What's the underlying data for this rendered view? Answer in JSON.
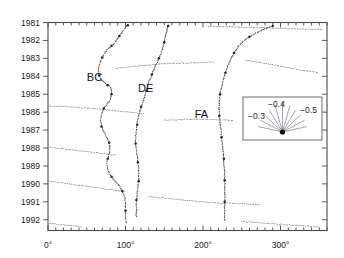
{
  "chart_data": {
    "type": "scatter",
    "title": "",
    "xlabel": "",
    "ylabel": "",
    "xlim": [
      0,
      360
    ],
    "ylim": [
      1981,
      1992.6
    ],
    "y_axis_inverted": true,
    "grid": false,
    "x_ticks_major": [
      "0°",
      "100°",
      "200°",
      "300°"
    ],
    "x_tick_values_major": [
      0,
      100,
      200,
      300
    ],
    "x_tick_interval_minor": 10,
    "y_ticks": [
      "1981",
      "1982",
      "1983",
      "1984",
      "1985",
      "1986",
      "1987",
      "1988",
      "1989",
      "1990",
      "1991",
      "1992"
    ],
    "y_tick_values": [
      1981,
      1982,
      1983,
      1984,
      1985,
      1986,
      1987,
      1988,
      1989,
      1990,
      1991,
      1992
    ],
    "annotations": [
      {
        "text": "BC",
        "x": 60,
        "y": 1984.25
      },
      {
        "text": "DE",
        "x": 126,
        "y": 1984.9
      },
      {
        "text": "FA",
        "x": 198,
        "y": 1986.35
      }
    ],
    "series": [
      {
        "name": "BC",
        "points": [
          [
            103,
            1981.15
          ],
          [
            100,
            1981.3
          ],
          [
            96,
            1981.5
          ],
          [
            92,
            1981.75
          ],
          [
            88,
            1982.0
          ],
          [
            85,
            1982.2
          ],
          [
            82,
            1982.3
          ],
          [
            78,
            1982.45
          ],
          [
            74,
            1982.65
          ],
          [
            70,
            1982.95
          ],
          [
            67,
            1983.25
          ],
          [
            65,
            1983.6
          ],
          [
            66,
            1983.95
          ],
          [
            69,
            1984.2
          ],
          [
            73,
            1984.35
          ],
          [
            77,
            1984.5
          ],
          [
            80,
            1984.6
          ],
          [
            82,
            1984.75
          ],
          [
            82,
            1985.0
          ],
          [
            80,
            1985.3
          ],
          [
            76,
            1985.55
          ],
          [
            72,
            1985.8
          ],
          [
            69,
            1986.1
          ],
          [
            68,
            1986.45
          ],
          [
            69,
            1986.8
          ],
          [
            72,
            1987.1
          ],
          [
            76,
            1987.4
          ],
          [
            79,
            1987.7
          ],
          [
            80,
            1988.0
          ],
          [
            79,
            1988.3
          ],
          [
            77,
            1988.6
          ],
          [
            76,
            1988.95
          ],
          [
            78,
            1989.3
          ],
          [
            82,
            1989.6
          ],
          [
            87,
            1989.85
          ],
          [
            92,
            1990.1
          ],
          [
            96,
            1990.4
          ],
          [
            99,
            1990.75
          ],
          [
            100,
            1991.1
          ],
          [
            100,
            1991.5
          ],
          [
            100,
            1991.9
          ],
          [
            101,
            1992.25
          ]
        ]
      },
      {
        "name": "DE",
        "points": [
          [
            155,
            1981.2
          ],
          [
            153,
            1981.5
          ],
          [
            151,
            1981.8
          ],
          [
            150,
            1982.1
          ],
          [
            148,
            1982.4
          ],
          [
            146,
            1982.7
          ],
          [
            143,
            1983.0
          ],
          [
            140,
            1983.3
          ],
          [
            137,
            1983.6
          ],
          [
            134,
            1983.9
          ],
          [
            131,
            1984.2
          ],
          [
            129,
            1984.5
          ],
          [
            127,
            1984.8
          ],
          [
            125,
            1985.1
          ],
          [
            123,
            1985.4
          ],
          [
            120,
            1985.7
          ],
          [
            118,
            1986.0
          ],
          [
            116,
            1986.35
          ],
          [
            115,
            1986.7
          ],
          [
            114,
            1987.05
          ],
          [
            113,
            1987.4
          ],
          [
            113,
            1987.75
          ],
          [
            114,
            1988.1
          ],
          [
            115,
            1988.45
          ],
          [
            116,
            1988.8
          ],
          [
            117,
            1989.15
          ],
          [
            117,
            1989.5
          ],
          [
            117,
            1989.85
          ],
          [
            116,
            1990.2
          ],
          [
            115,
            1990.55
          ],
          [
            114,
            1990.9
          ],
          [
            114,
            1991.25
          ],
          [
            114,
            1991.6
          ],
          [
            114,
            1991.9
          ]
        ]
      },
      {
        "name": "FA",
        "points": [
          [
            290,
            1981.2
          ],
          [
            280,
            1981.35
          ],
          [
            270,
            1981.55
          ],
          [
            260,
            1981.8
          ],
          [
            252,
            1982.05
          ],
          [
            245,
            1982.35
          ],
          [
            240,
            1982.7
          ],
          [
            236,
            1983.05
          ],
          [
            232,
            1983.4
          ],
          [
            229,
            1983.8
          ],
          [
            226,
            1984.2
          ],
          [
            224,
            1984.6
          ],
          [
            222,
            1985.0
          ],
          [
            221,
            1985.4
          ],
          [
            221,
            1985.8
          ],
          [
            221,
            1986.2
          ],
          [
            222,
            1986.6
          ],
          [
            223,
            1987.0
          ],
          [
            224,
            1987.4
          ],
          [
            225,
            1987.8
          ],
          [
            226,
            1988.2
          ],
          [
            227,
            1988.6
          ],
          [
            227,
            1989.0
          ],
          [
            228,
            1989.4
          ],
          [
            228,
            1989.8
          ],
          [
            228,
            1990.2
          ],
          [
            228,
            1990.6
          ],
          [
            228,
            1991.0
          ],
          [
            228,
            1991.4
          ],
          [
            228,
            1991.8
          ],
          [
            228,
            1992.1
          ]
        ]
      },
      {
        "name": "drift-1981",
        "points": [
          [
            205,
            1981.2
          ],
          [
            240,
            1981.25
          ],
          [
            280,
            1981.3
          ],
          [
            320,
            1981.35
          ],
          [
            355,
            1981.4
          ]
        ]
      },
      {
        "name": "drift-1983",
        "points": [
          [
            88,
            1983.55
          ],
          [
            120,
            1983.4
          ],
          [
            150,
            1983.3
          ],
          [
            185,
            1983.25
          ],
          [
            215,
            1983.2
          ]
        ]
      },
      {
        "name": "drift-1983b",
        "points": [
          [
            255,
            1983.1
          ],
          [
            290,
            1983.35
          ],
          [
            320,
            1983.6
          ],
          [
            350,
            1983.8
          ]
        ]
      },
      {
        "name": "drift-1986",
        "points": [
          [
            2,
            1985.65
          ],
          [
            30,
            1985.7
          ],
          [
            62,
            1985.8
          ],
          [
            95,
            1985.95
          ],
          [
            125,
            1986.1
          ]
        ]
      },
      {
        "name": "drift-1986b",
        "points": [
          [
            150,
            1986.45
          ],
          [
            180,
            1986.4
          ],
          [
            210,
            1986.4
          ],
          [
            240,
            1986.45
          ]
        ]
      },
      {
        "name": "drift-1988",
        "points": [
          [
            2,
            1987.95
          ],
          [
            30,
            1988.1
          ],
          [
            60,
            1988.25
          ],
          [
            88,
            1988.4
          ]
        ]
      },
      {
        "name": "drift-1990",
        "points": [
          [
            2,
            1989.85
          ],
          [
            35,
            1990.05
          ],
          [
            70,
            1990.25
          ],
          [
            100,
            1990.45
          ]
        ]
      },
      {
        "name": "drift-1991",
        "points": [
          [
            130,
            1990.7
          ],
          [
            165,
            1990.85
          ],
          [
            200,
            1991.0
          ],
          [
            228,
            1991.1
          ]
        ]
      },
      {
        "name": "drift-1991b",
        "points": [
          [
            228,
            1991.05
          ],
          [
            250,
            1991.1
          ],
          [
            275,
            1991.15
          ]
        ]
      },
      {
        "name": "drift-1992",
        "points": [
          [
            2,
            1992.2
          ],
          [
            25,
            1992.3
          ],
          [
            45,
            1992.4
          ]
        ]
      },
      {
        "name": "drift-1992b",
        "points": [
          [
            250,
            1992.1
          ],
          [
            285,
            1992.2
          ],
          [
            315,
            1992.3
          ],
          [
            350,
            1992.4
          ]
        ]
      }
    ]
  },
  "legend": {
    "name": "fan-legend",
    "labels": [
      {
        "text": "−0.3",
        "position": "left"
      },
      {
        "text": "−0.4",
        "position": "top"
      },
      {
        "text": "−0.5",
        "position": "right"
      }
    ],
    "ray_count": 11,
    "dot_label": "origin-dot"
  },
  "colors": {
    "axis": "#4a4a55",
    "data": "#2a2a33",
    "legend_border": "#6b6b75",
    "legend_ray": "#7a7a85",
    "text": "#1a1a1a",
    "background": "#ffffff"
  }
}
